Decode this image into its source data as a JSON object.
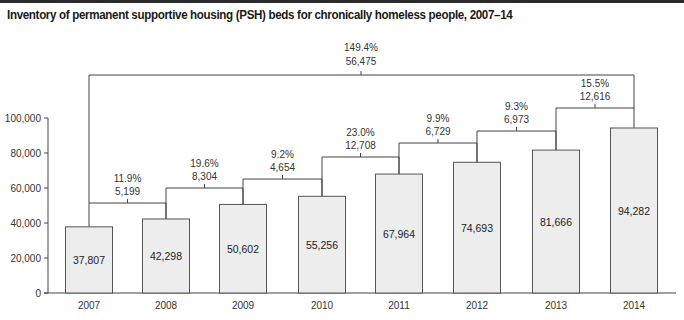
{
  "title": "Inventory of permanent supportive housing (PSH) beds for chronically homeless people, 2007–14",
  "colors": {
    "bar_fill": "#ededed",
    "bar_stroke": "#555555",
    "line": "#444444",
    "title_rule": "#2a2a2a"
  },
  "chart_data": {
    "type": "bar",
    "title": "Inventory of permanent supportive housing (PSH) beds for chronically homeless people, 2007–14",
    "xlabel": "",
    "ylabel": "",
    "ylim": [
      0,
      100000
    ],
    "yticks": [
      "0",
      "20,000",
      "40,000",
      "60,000",
      "80,000",
      "100,000"
    ],
    "grid": false,
    "legend": null,
    "categories": [
      "2007",
      "2008",
      "2009",
      "2010",
      "2011",
      "2012",
      "2013",
      "2014"
    ],
    "values": [
      37807,
      42298,
      50602,
      55256,
      67964,
      74693,
      81666,
      94282
    ],
    "value_labels": [
      "37,807",
      "42,298",
      "50,602",
      "55,256",
      "67,964",
      "74,693",
      "81,666",
      "94,282"
    ],
    "year_over_year_changes": [
      {
        "from": "2007",
        "to": "2008",
        "percent": "11.9%",
        "count": "5,199"
      },
      {
        "from": "2008",
        "to": "2009",
        "percent": "19.6%",
        "count": "8,304"
      },
      {
        "from": "2009",
        "to": "2010",
        "percent": "9.2%",
        "count": "4,654"
      },
      {
        "from": "2010",
        "to": "2011",
        "percent": "23.0%",
        "count": "12,708"
      },
      {
        "from": "2011",
        "to": "2012",
        "percent": "9.9%",
        "count": "6,729"
      },
      {
        "from": "2012",
        "to": "2013",
        "percent": "9.3%",
        "count": "6,973"
      },
      {
        "from": "2013",
        "to": "2014",
        "percent": "15.5%",
        "count": "12,616"
      }
    ],
    "overall_change": {
      "from": "2007",
      "to": "2014",
      "percent": "149.4%",
      "count": "56,475"
    }
  }
}
